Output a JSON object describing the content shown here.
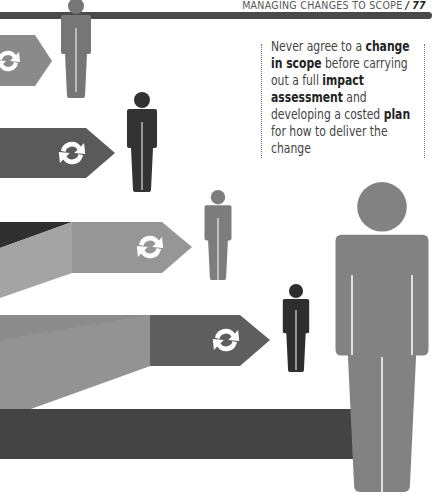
{
  "header": {
    "section_title": "MANAGING CHANGES TO SCOPE",
    "separator": "/",
    "page_number": "77"
  },
  "quote": {
    "parts": [
      {
        "text": "Never agree to a ",
        "bold": false
      },
      {
        "text": "change in scope",
        "bold": true
      },
      {
        "text": " before carrying out a full ",
        "bold": false
      },
      {
        "text": "impact assessment",
        "bold": true
      },
      {
        "text": " and developing a costed ",
        "bold": false
      },
      {
        "text": "plan",
        "bold": true
      },
      {
        "text": " for how to deliver the change",
        "bold": false
      }
    ]
  },
  "illustration": {
    "description": "Arrow bands with refresh icons pointing at standing human figures",
    "icons": [
      "refresh-icon",
      "refresh-icon",
      "refresh-icon",
      "refresh-icon"
    ],
    "colors": {
      "dark": "#3d3d3d",
      "mid_dark": "#5e5e5e",
      "mid": "#808080",
      "light": "#9a9a9a",
      "rule": "#4a4a4a"
    }
  }
}
